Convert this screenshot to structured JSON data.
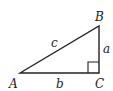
{
  "diagram": {
    "type": "right-triangle",
    "vertices": [
      {
        "label": "A",
        "x": 20,
        "y": 73
      },
      {
        "label": "B",
        "x": 99,
        "y": 26
      },
      {
        "label": "C",
        "x": 99,
        "y": 73
      }
    ],
    "sides": [
      {
        "label": "a",
        "from": "B",
        "to": "C"
      },
      {
        "label": "b",
        "from": "A",
        "to": "C"
      },
      {
        "label": "c",
        "from": "A",
        "to": "B"
      }
    ],
    "right_angle_at": "C",
    "stroke_color": "#222222"
  }
}
